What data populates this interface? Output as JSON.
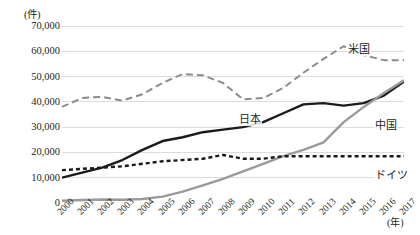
{
  "chart_data": {
    "type": "line",
    "title": "",
    "subtitle": "",
    "xlabel": "(年)",
    "ylabel": "(件)",
    "x": [
      2000,
      2001,
      2002,
      2003,
      2004,
      2005,
      2006,
      2007,
      2008,
      2009,
      2010,
      2011,
      2012,
      2013,
      2014,
      2015,
      2016,
      2017
    ],
    "xtick_labels": [
      "2000",
      "2001",
      "2002",
      "2003",
      "2004",
      "2005",
      "2006",
      "2007",
      "2008",
      "2009",
      "2010",
      "2011",
      "2012",
      "2013",
      "2014",
      "2015",
      "2016",
      "2017"
    ],
    "ytick_labels": [
      "70,000",
      "60,000",
      "50,000",
      "40,000",
      "30,000",
      "20,000",
      "10,000",
      "0"
    ],
    "ytick_values": [
      70000,
      60000,
      50000,
      40000,
      30000,
      20000,
      10000,
      0
    ],
    "ylim": [
      0,
      70000
    ],
    "xlim": [
      2000,
      2017
    ],
    "grid": "horizontal",
    "legend": "inline-labels",
    "series": [
      {
        "name": "米国",
        "style": "dashed",
        "color": "#8c8c8c",
        "label_x": 2014,
        "values": [
          38000,
          41500,
          42000,
          40500,
          43000,
          47500,
          51000,
          50500,
          47500,
          41000,
          41500,
          45500,
          51500,
          57000,
          62000,
          58500,
          56500,
          56500
        ]
      },
      {
        "name": "日本",
        "style": "solid",
        "color": "#1a1a1a",
        "label_x": 2010,
        "values": [
          10000,
          12000,
          14000,
          17000,
          21000,
          24500,
          26000,
          28000,
          29000,
          30000,
          32000,
          35500,
          39000,
          39500,
          38500,
          39500,
          42500,
          48000
        ]
      },
      {
        "name": "中国",
        "style": "solid",
        "color": "#9a9a9a",
        "label_x": 2016,
        "values": [
          900,
          1200,
          1400,
          1300,
          1600,
          2500,
          4500,
          7000,
          9500,
          12500,
          15500,
          18500,
          21000,
          24000,
          32000,
          38000,
          43500,
          48500
        ]
      },
      {
        "name": "ドイツ",
        "style": "dashed-short",
        "color": "#1a1a1a",
        "label_x": 2016,
        "values": [
          13000,
          13500,
          14000,
          14500,
          15500,
          16500,
          17000,
          17500,
          19000,
          17500,
          17500,
          18500,
          18500,
          18500,
          18500,
          18500,
          18500,
          18500
        ]
      }
    ]
  }
}
